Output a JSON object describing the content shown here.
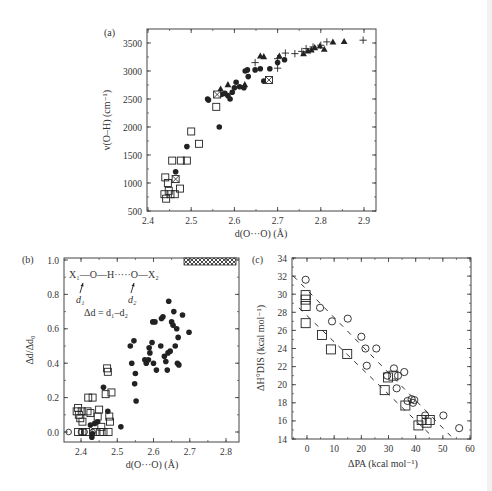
{
  "chart_data": [
    {
      "id": "a",
      "panel_label": "(a)",
      "type": "scatter",
      "title": "",
      "xlabel": "d(O···O) (Å)",
      "ylabel": "ν(O–H) (cm⁻¹)",
      "xlim": [
        2.4,
        2.9
      ],
      "ylim": [
        500,
        3700
      ],
      "xticks": [
        "2.4",
        "2.5",
        "2.6",
        "2.7",
        "2.8",
        "2.9"
      ],
      "yticks": [
        "500",
        "1000",
        "1500",
        "2000",
        "2500",
        "3000",
        "3500"
      ],
      "grid": false,
      "legend": null,
      "series": [
        {
          "name": "open squares",
          "marker": "square-open",
          "points": [
            [
              2.438,
              800
            ],
            [
              2.44,
              1100
            ],
            [
              2.442,
              720
            ],
            [
              2.446,
              1000
            ],
            [
              2.448,
              860
            ],
            [
              2.452,
              800
            ],
            [
              2.456,
              1400
            ],
            [
              2.462,
              800
            ],
            [
              2.474,
              900
            ],
            [
              2.476,
              1400
            ],
            [
              2.49,
              1400
            ],
            [
              2.5,
              1920
            ],
            [
              2.518,
              1700
            ],
            [
              2.558,
              2360
            ]
          ]
        },
        {
          "name": "filled circles",
          "marker": "circle-filled",
          "points": [
            [
              2.464,
              1200
            ],
            [
              2.49,
              1650
            ],
            [
              2.538,
              2500
            ],
            [
              2.54,
              2480
            ],
            [
              2.565,
              2000
            ],
            [
              2.57,
              2580
            ],
            [
              2.578,
              2600
            ],
            [
              2.585,
              2560
            ],
            [
              2.59,
              2500
            ],
            [
              2.595,
              2620
            ],
            [
              2.6,
              2700
            ],
            [
              2.604,
              2800
            ],
            [
              2.612,
              2720
            ],
            [
              2.622,
              2700
            ],
            [
              2.625,
              3000
            ],
            [
              2.63,
              3020
            ],
            [
              2.632,
              2900
            ],
            [
              2.648,
              3020
            ],
            [
              2.66,
              3040
            ],
            [
              2.682,
              3040
            ],
            [
              2.7,
              3150
            ],
            [
              2.716,
              3200
            ],
            [
              2.668,
              2820
            ]
          ]
        },
        {
          "name": "filled triangles",
          "marker": "triangle-filled",
          "points": [
            [
              2.568,
              2680
            ],
            [
              2.585,
              2760
            ],
            [
              2.624,
              2760
            ],
            [
              2.66,
              3270
            ],
            [
              2.668,
              3260
            ],
            [
              2.704,
              3270
            ],
            [
              2.76,
              3310
            ],
            [
              2.77,
              3360
            ],
            [
              2.778,
              3380
            ],
            [
              2.786,
              3420
            ],
            [
              2.798,
              3450
            ],
            [
              2.808,
              3390
            ],
            [
              2.828,
              3520
            ],
            [
              2.854,
              3530
            ]
          ]
        },
        {
          "name": "plus",
          "marker": "plus",
          "points": [
            [
              2.648,
              3150
            ],
            [
              2.7,
              3220
            ],
            [
              2.7,
              3050
            ],
            [
              2.718,
              3320
            ],
            [
              2.74,
              3310
            ],
            [
              2.756,
              3350
            ],
            [
              2.766,
              3400
            ],
            [
              2.782,
              3430
            ],
            [
              2.8,
              3460
            ],
            [
              2.814,
              3520
            ],
            [
              2.898,
              3550
            ]
          ]
        },
        {
          "name": "crossed squares",
          "marker": "square-crossed",
          "points": [
            [
              2.464,
              1070
            ],
            [
              2.56,
              2580
            ],
            [
              2.68,
              2840
            ]
          ]
        }
      ]
    },
    {
      "id": "b",
      "panel_label": "(b)",
      "type": "scatter",
      "title": "",
      "xlabel": "d(O···O) (Å)",
      "ylabel": "Δd/Δd₀",
      "xlim": [
        2.35,
        2.84
      ],
      "ylim": [
        -0.06,
        1.0
      ],
      "xticks": [
        "2.4",
        "2.5",
        "2.6",
        "2.7",
        "2.8"
      ],
      "yticks": [
        "0.0",
        "0.2",
        "0.4",
        "0.6",
        "0.8",
        "1.0"
      ],
      "grid": false,
      "annotations": [
        "X₁—O—H·····O—X₂",
        "d₁",
        "d₂",
        "Δd = d₁–d₂"
      ],
      "hatched_band": {
        "x_from": 2.71,
        "x_to": 2.84,
        "y": 0.97
      },
      "series": [
        {
          "name": "open circles",
          "marker": "circle-open",
          "points": [
            [
              2.366,
              0.0
            ],
            [
              2.4,
              0.0
            ],
            [
              2.41,
              0.0
            ],
            [
              2.432,
              0.0
            ]
          ]
        },
        {
          "name": "open squares",
          "marker": "square-open",
          "points": [
            [
              2.388,
              0.12
            ],
            [
              2.392,
              0.14
            ],
            [
              2.394,
              0.1
            ],
            [
              2.398,
              0.08
            ],
            [
              2.402,
              0.12
            ],
            [
              2.404,
              0.06
            ],
            [
              2.392,
              0.0
            ],
            [
              2.404,
              0.0
            ],
            [
              2.414,
              0.0
            ],
            [
              2.418,
              0.12
            ],
            [
              2.42,
              0.2
            ],
            [
              2.426,
              0.11
            ],
            [
              2.432,
              0.2
            ],
            [
              2.44,
              0.0
            ],
            [
              2.446,
              0.09
            ],
            [
              2.45,
              0.13
            ],
            [
              2.452,
              0.0
            ],
            [
              2.456,
              0.03
            ],
            [
              2.462,
              0.0
            ],
            [
              2.468,
              0.22
            ],
            [
              2.472,
              0.37
            ],
            [
              2.474,
              0.35
            ],
            [
              2.476,
              0.0
            ],
            [
              2.478,
              0.09
            ],
            [
              2.48,
              0.06
            ],
            [
              2.484,
              0.23
            ]
          ]
        },
        {
          "name": "filled circles",
          "marker": "circle-filled",
          "points": [
            [
              2.426,
              0.04
            ],
            [
              2.43,
              -0.03
            ],
            [
              2.432,
              -0.01
            ],
            [
              2.438,
              0.05
            ],
            [
              2.446,
              0.06
            ],
            [
              2.462,
              0.26
            ],
            [
              2.474,
              0.12
            ],
            [
              2.51,
              0.03
            ],
            [
              2.536,
              0.5
            ],
            [
              2.54,
              0.4
            ],
            [
              2.546,
              0.53
            ],
            [
              2.548,
              0.28
            ],
            [
              2.55,
              0.34
            ],
            [
              2.552,
              0.18
            ],
            [
              2.576,
              0.42
            ],
            [
              2.58,
              0.4
            ],
            [
              2.586,
              0.42
            ],
            [
              2.588,
              0.49
            ],
            [
              2.59,
              0.46
            ],
            [
              2.596,
              0.52
            ],
            [
              2.598,
              0.64
            ],
            [
              2.6,
              0.4
            ],
            [
              2.604,
              0.64
            ],
            [
              2.608,
              0.36
            ],
            [
              2.62,
              0.5
            ],
            [
              2.622,
              0.66
            ],
            [
              2.626,
              0.67
            ],
            [
              2.63,
              0.44
            ],
            [
              2.634,
              0.41
            ],
            [
              2.638,
              0.36
            ],
            [
              2.64,
              0.46
            ],
            [
              2.642,
              0.76
            ],
            [
              2.646,
              0.47
            ],
            [
              2.65,
              0.64
            ],
            [
              2.654,
              0.62
            ],
            [
              2.656,
              0.7
            ],
            [
              2.66,
              0.5
            ],
            [
              2.664,
              0.6
            ],
            [
              2.666,
              0.4
            ],
            [
              2.668,
              0.55
            ],
            [
              2.67,
              0.39
            ],
            [
              2.68,
              0.68
            ],
            [
              2.698,
              0.58
            ]
          ]
        }
      ]
    },
    {
      "id": "c",
      "panel_label": "(c)",
      "type": "scatter",
      "title": "",
      "xlabel": "ΔPA (kcal mol⁻¹)",
      "ylabel": "ΔH°DIS (kcal mol⁻¹)",
      "xlim": [
        -5,
        60
      ],
      "ylim": [
        14,
        34
      ],
      "xticks": [
        "0",
        "10",
        "20",
        "30",
        "40",
        "50",
        "60"
      ],
      "yticks": [
        "14",
        "16",
        "18",
        "20",
        "22",
        "24",
        "26",
        "28",
        "30",
        "32",
        "34"
      ],
      "grid": false,
      "series": [
        {
          "name": "open circles",
          "marker": "circle-open",
          "points": [
            [
              -0.5,
              31.6
            ],
            [
              4.8,
              28.5
            ],
            [
              9.2,
              27.0
            ],
            [
              15.0,
              27.3
            ],
            [
              20.0,
              25.3
            ],
            [
              21.5,
              24.0
            ],
            [
              22.0,
              22.1
            ],
            [
              25.5,
              24.0
            ],
            [
              29.5,
              21.0
            ],
            [
              32.0,
              21.8
            ],
            [
              33.0,
              19.6
            ],
            [
              33.5,
              21.0
            ],
            [
              35.8,
              21.4
            ],
            [
              37.0,
              18.2
            ],
            [
              38.5,
              18.4
            ],
            [
              39.0,
              18.0
            ],
            [
              39.5,
              18.3
            ],
            [
              43.5,
              16.6
            ],
            [
              50.2,
              16.6
            ],
            [
              56.0,
              15.2
            ]
          ]
        },
        {
          "name": "open squares",
          "marker": "square-open",
          "points": [
            [
              -0.5,
              29.9
            ],
            [
              -0.5,
              29.4
            ],
            [
              -0.5,
              28.7
            ],
            [
              -0.5,
              26.8
            ],
            [
              5.5,
              25.5
            ],
            [
              8.8,
              23.9
            ],
            [
              14.8,
              23.4
            ],
            [
              28.6,
              19.4
            ],
            [
              29.8,
              20.8
            ],
            [
              31.8,
              21.0
            ],
            [
              36.2,
              17.7
            ],
            [
              41.0,
              15.5
            ],
            [
              42.2,
              16.1
            ],
            [
              44.0,
              15.8
            ],
            [
              45.2,
              16.1
            ]
          ]
        }
      ],
      "fit_lines": [
        {
          "name": "upper dashed fit",
          "from": [
            -5,
            32.0
          ],
          "to": [
            53,
            14.3
          ]
        },
        {
          "name": "lower dashed fit",
          "from": [
            -3,
            28.5
          ],
          "to": [
            46,
            14.3
          ]
        }
      ]
    }
  ]
}
